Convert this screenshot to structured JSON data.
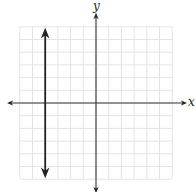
{
  "chart_data": {
    "type": "line",
    "title": "",
    "xlabel": "x",
    "ylabel": "y",
    "xlim": [
      -6,
      6
    ],
    "ylim": [
      -6,
      6
    ],
    "grid": true,
    "tick_labels": false,
    "series": [
      {
        "name": "vertical line",
        "equation": "x = -4",
        "x": [
          -4,
          -4
        ],
        "y": [
          -5.5,
          5.5
        ],
        "arrows": "both"
      }
    ]
  },
  "labels": {
    "x_axis": "x",
    "y_axis": "y"
  },
  "colors": {
    "grid": "#e4e4e4",
    "axis": "#333333",
    "line": "#222222"
  }
}
